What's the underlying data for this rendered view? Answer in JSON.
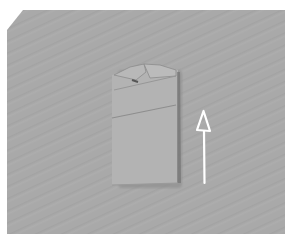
{
  "image": {
    "description": "Folded cloth napkin/garment on gray textured background with upward arrow indicating fold direction",
    "background_color": "#a8a8a8",
    "fabric_color": "#b4b4b4",
    "arrow": {
      "direction": "up",
      "color": "#ffffff"
    }
  }
}
